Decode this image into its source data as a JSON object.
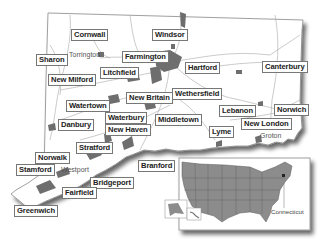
{
  "map": {
    "region": "Connecticut",
    "theme": {
      "land": "#ffffff",
      "outline": "#888888",
      "urban_fill": "#6e6e6e",
      "roads": "#9a9a9a",
      "shadow": "#555555",
      "us_states_fill": "#8c8c8c"
    },
    "towns": [
      {
        "id": "cornwall",
        "name": "Cornwall"
      },
      {
        "id": "windsor",
        "name": "Windsor"
      },
      {
        "id": "sharon",
        "name": "Sharon"
      },
      {
        "id": "farmington",
        "name": "Farmington"
      },
      {
        "id": "hartford",
        "name": "Hartford"
      },
      {
        "id": "canterbury",
        "name": "Canterbury"
      },
      {
        "id": "litchfield",
        "name": "Litchfield"
      },
      {
        "id": "new-milford",
        "name": "New Milford"
      },
      {
        "id": "new-britain",
        "name": "New Britain"
      },
      {
        "id": "wethersfield",
        "name": "Wethersfield"
      },
      {
        "id": "watertown",
        "name": "Watertown"
      },
      {
        "id": "lebanon",
        "name": "Lebanon"
      },
      {
        "id": "norwich",
        "name": "Norwich"
      },
      {
        "id": "waterbury",
        "name": "Waterbury"
      },
      {
        "id": "middletown",
        "name": "Middletown"
      },
      {
        "id": "danbury",
        "name": "Danbury"
      },
      {
        "id": "new-haven",
        "name": "New Haven"
      },
      {
        "id": "lyme",
        "name": "Lyme"
      },
      {
        "id": "new-london",
        "name": "New London"
      },
      {
        "id": "stratford",
        "name": "Stratford"
      },
      {
        "id": "norwalk",
        "name": "Norwalk"
      },
      {
        "id": "branford",
        "name": "Branford"
      },
      {
        "id": "stamford",
        "name": "Stamford"
      },
      {
        "id": "bridgeport",
        "name": "Bridgeport"
      },
      {
        "id": "fairfield",
        "name": "Fairfield"
      },
      {
        "id": "greenwich",
        "name": "Greenwich"
      }
    ],
    "unboxed_places": [
      {
        "id": "torrington",
        "name": "Torrington"
      },
      {
        "id": "westport",
        "name": "Westport"
      },
      {
        "id": "groton",
        "name": "Groton"
      }
    ],
    "inset": {
      "title": "United States",
      "highlight_label": "Connecticut"
    }
  }
}
